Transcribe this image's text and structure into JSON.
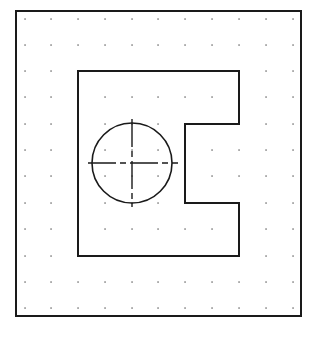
{
  "drawing": {
    "background": "#ffffff",
    "stroke_color": "#1a1a1a",
    "grid_color": "#555555",
    "border": {
      "x1": 16,
      "y1": 11,
      "x2": 301,
      "y2": 316
    },
    "grid": {
      "xs": [
        25,
        51,
        78,
        105,
        132,
        158,
        185,
        212,
        239,
        266,
        293
      ],
      "ys": [
        19,
        45,
        71,
        97,
        124,
        150,
        176,
        203,
        229,
        256,
        282,
        308
      ]
    },
    "outline_points": [
      [
        78,
        71
      ],
      [
        239,
        71
      ],
      [
        239,
        124
      ],
      [
        185,
        124
      ],
      [
        185,
        203
      ],
      [
        239,
        203
      ],
      [
        239,
        256
      ],
      [
        78,
        256
      ]
    ],
    "circle": {
      "cx": 132,
      "cy": 163,
      "r": 40
    },
    "centerline_h": {
      "x1": 88,
      "x2": 178,
      "y": 163
    },
    "centerline_v": {
      "x": 132,
      "y1": 119,
      "y2": 207
    }
  }
}
